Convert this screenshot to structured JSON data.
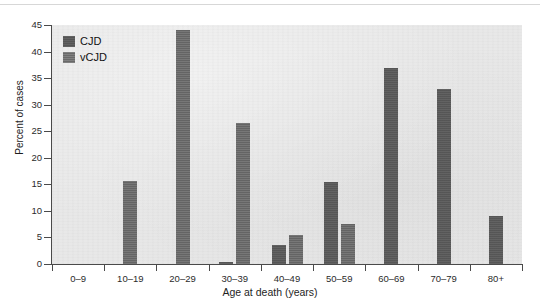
{
  "chart_data": {
    "type": "bar",
    "title": "",
    "subtitle": "",
    "xlabel": "Age at death (years)",
    "ylabel": "Percent of cases",
    "categories": [
      "0–9",
      "10–19",
      "20–29",
      "30–39",
      "40–49",
      "50–59",
      "60–69",
      "70–79",
      "80+"
    ],
    "series": [
      {
        "name": "CJD",
        "color": "#5a5a5a",
        "values": [
          0,
          0,
          0,
          0.3,
          3.5,
          15.5,
          37,
          33,
          9
        ]
      },
      {
        "name": "vCJD",
        "color": "#6d6d6d",
        "values": [
          0,
          15.7,
          44,
          26.5,
          5.5,
          7.5,
          0,
          0,
          0
        ]
      }
    ],
    "ylim": [
      0,
      45
    ],
    "yticks": [
      0,
      5,
      10,
      15,
      20,
      25,
      30,
      35,
      40,
      45
    ],
    "ytick_labels": [
      "0",
      "5",
      "10",
      "15",
      "20",
      "25",
      "30",
      "35",
      "40",
      "45"
    ],
    "grid": false,
    "legend_position": "top-left-inside",
    "plot_background": "#e8e8e8",
    "axis_color": "#4a4a4a"
  },
  "legend": {
    "entries": [
      {
        "label": "CJD",
        "swatch": "cjd-swatch"
      },
      {
        "label": "vCJD",
        "swatch": "vcjd-swatch"
      }
    ]
  }
}
